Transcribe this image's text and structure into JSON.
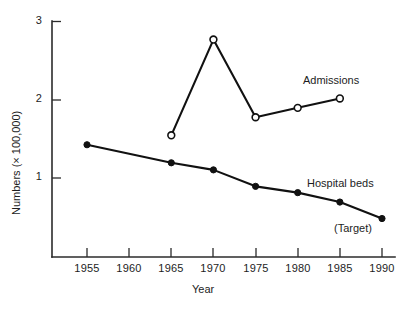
{
  "chart_data": {
    "type": "line",
    "title": "",
    "subtitle": "",
    "xlabel": "Year",
    "ylabel": "Numbers (× 100,000)",
    "xlim": [
      1953,
      1991
    ],
    "ylim": [
      0,
      3
    ],
    "xticks": [
      1955,
      1960,
      1965,
      1970,
      1975,
      1980,
      1985,
      1990
    ],
    "xtick_labels": [
      "1955",
      "1960",
      "1965",
      "1970",
      "1975",
      "1980",
      "1985",
      "1990"
    ],
    "yticks": [
      1,
      2,
      3
    ],
    "ytick_labels": [
      "1",
      "2",
      "3"
    ],
    "grid": false,
    "legend_position": "inline-annotations",
    "series": [
      {
        "name": "Admissions",
        "marker": "open-circle",
        "label": "Admissions",
        "x": [
          1965,
          1970,
          1975,
          1980,
          1985
        ],
        "values": [
          1.55,
          2.77,
          1.78,
          1.9,
          2.02
        ]
      },
      {
        "name": "Hospital beds",
        "marker": "filled-circle",
        "label": "Hospital beds",
        "x": [
          1955,
          1965,
          1970,
          1975,
          1980,
          1985,
          1990
        ],
        "values": [
          1.43,
          1.2,
          1.11,
          0.9,
          0.82,
          0.7,
          0.49
        ]
      }
    ],
    "annotations": [
      {
        "text": "Admissions",
        "x": 1985,
        "y": 2.25
      },
      {
        "text": "Hospital beds",
        "x": 1983,
        "y": 1.02
      },
      {
        "text": "(Target)",
        "x": 1988,
        "y": 0.45
      }
    ]
  },
  "axes": {
    "y_tick_3": "3",
    "y_tick_2": "2",
    "y_tick_1": "1",
    "x_tick_1955": "1955",
    "x_tick_1960": "1960",
    "x_tick_1965": "1965",
    "x_tick_1970": "1970",
    "x_tick_1975": "1975",
    "x_tick_1980": "1980",
    "x_tick_1985": "1985",
    "x_tick_1990": "1990",
    "y_axis_title": "Numbers (× 100,000)",
    "x_axis_title": "Year"
  },
  "labels": {
    "admissions": "Admissions",
    "hospital_beds": "Hospital beds",
    "target": "(Target)"
  }
}
